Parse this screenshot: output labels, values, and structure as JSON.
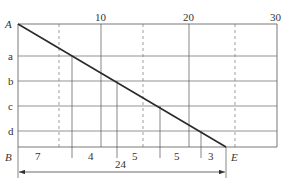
{
  "diagram": {
    "type": "grid-with-diagonal",
    "top_axis_ticks": [
      {
        "label": "10",
        "x": 101
      },
      {
        "label": "20",
        "x": 189
      },
      {
        "label": "30",
        "x": 271
      }
    ],
    "corner_labels": {
      "top_left": "A",
      "bottom_left": "B",
      "bottom_end": "E"
    },
    "row_labels": [
      "a",
      "b",
      "c",
      "d"
    ],
    "bottom_segments": [
      {
        "label": "7",
        "x": 38
      },
      {
        "label": "4",
        "x": 92
      },
      {
        "label": "5",
        "x": 136
      },
      {
        "label": "5",
        "x": 178
      },
      {
        "label": "3",
        "x": 212
      }
    ],
    "total_dimension": {
      "label": "24"
    },
    "colors": {
      "line": "#3a3a3a",
      "grid": "#555555",
      "text": "#333333"
    }
  }
}
